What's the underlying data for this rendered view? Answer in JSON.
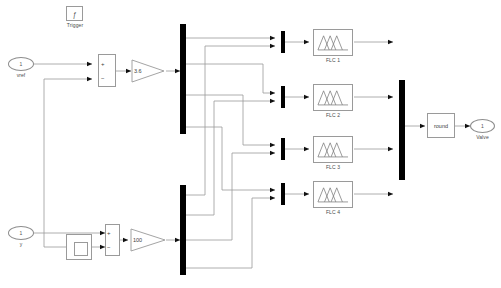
{
  "diagram": {
    "background": "#ffffff",
    "line_color": "#9a9a9a",
    "bar_color": "#000000",
    "block_border": "#9a9a9a",
    "text_color": "#4a4a4a"
  },
  "trigger": {
    "label": "Trigger",
    "glyph": "ƒ",
    "icon_name": "trigger-icon"
  },
  "inputs": [
    {
      "port_number": "1",
      "label": "vref",
      "name": "inport-vref"
    },
    {
      "port_number": "1",
      "label": "y",
      "name": "inport-y"
    }
  ],
  "sums": [
    {
      "name": "sum-top",
      "plus": "+",
      "minus": "−"
    },
    {
      "name": "sum-bottom",
      "plus": "+",
      "minus": "−"
    }
  ],
  "unit_delay": {
    "label": "",
    "name": "unit-delay-block",
    "icon_name": "unit-delay-icon"
  },
  "gains": [
    {
      "value": "3.6",
      "name": "gain-error"
    },
    {
      "value": "100",
      "name": "gain-delta-error"
    }
  ],
  "demuxes": [
    {
      "name": "demux-error",
      "outputs": 4
    },
    {
      "name": "demux-delta-error",
      "outputs": 4
    }
  ],
  "muxes": [
    {
      "name": "mux-flc-1",
      "inputs": 2
    },
    {
      "name": "mux-flc-2",
      "inputs": 2
    },
    {
      "name": "mux-flc-3",
      "inputs": 2
    },
    {
      "name": "mux-flc-4",
      "inputs": 2
    },
    {
      "name": "mux-output",
      "inputs": 4
    }
  ],
  "flc_blocks": [
    {
      "label": "FLC 1",
      "name": "flc-block-1",
      "icon_name": "fuzzy-membership-icon"
    },
    {
      "label": "FLC 2",
      "name": "flc-block-2",
      "icon_name": "fuzzy-membership-icon"
    },
    {
      "label": "FLC 3",
      "name": "flc-block-3",
      "icon_name": "fuzzy-membership-icon"
    },
    {
      "label": "FLC 4",
      "name": "flc-block-4",
      "icon_name": "fuzzy-membership-icon"
    }
  ],
  "round_block": {
    "label": "round",
    "name": "round-block"
  },
  "output": {
    "port_number": "1",
    "label": "Valve",
    "name": "outport-valve"
  }
}
